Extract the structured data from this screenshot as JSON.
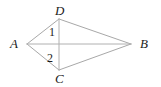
{
  "figure": {
    "name": "kite-abcd-with-diagonals",
    "background_color": "#ffffff",
    "line_color": "#a8a8a8",
    "label_color": "#1b1b1b",
    "vertices": {
      "A": {
        "label": "A",
        "x": 27,
        "y": 44
      },
      "B": {
        "label": "B",
        "x": 131,
        "y": 44
      },
      "C": {
        "label": "C",
        "x": 59,
        "y": 70
      },
      "D": {
        "label": "D",
        "x": 59,
        "y": 19
      }
    },
    "angle_labels": [
      {
        "label": "1",
        "x": 52,
        "y": 32,
        "at_vertex": "D"
      },
      {
        "label": "2",
        "x": 51,
        "y": 58,
        "at_vertex": "C"
      }
    ],
    "edges": [
      {
        "name": "side-AD",
        "from": "A",
        "to": "D"
      },
      {
        "name": "side-DB",
        "from": "D",
        "to": "B"
      },
      {
        "name": "side-BC",
        "from": "B",
        "to": "C"
      },
      {
        "name": "side-CA",
        "from": "C",
        "to": "A"
      }
    ],
    "diagonals": [
      {
        "name": "diagonal-AB",
        "from": "A",
        "to": "B"
      },
      {
        "name": "diagonal-DC",
        "from": "D",
        "to": "C"
      }
    ]
  }
}
